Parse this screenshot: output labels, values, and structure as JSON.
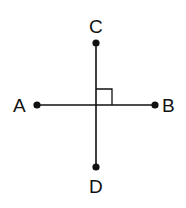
{
  "diagram": {
    "colors": {
      "line": "#111111",
      "background": "#ffffff"
    },
    "points": {
      "A": {
        "label": "A",
        "x": 37,
        "y": 105
      },
      "B": {
        "label": "B",
        "x": 155,
        "y": 105
      },
      "C": {
        "label": "C",
        "x": 96,
        "y": 43
      },
      "D": {
        "label": "D",
        "x": 96,
        "y": 167
      }
    },
    "segments": [
      {
        "from": "A",
        "to": "B"
      },
      {
        "from": "C",
        "to": "D"
      }
    ],
    "right_angle_marker": {
      "at": "intersection",
      "quadrant": "upper-right",
      "size": 16
    }
  }
}
